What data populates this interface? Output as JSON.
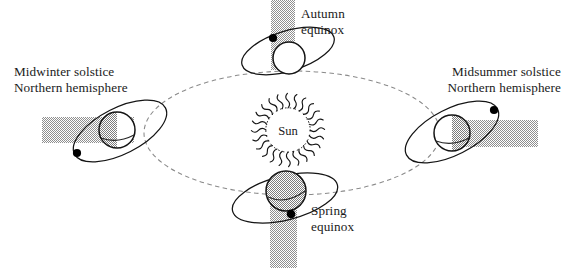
{
  "figure": {
    "background_color": "#ffffff",
    "ink_color": "#141414",
    "shadow_color": "#9b9b9b",
    "orbit_color": "#8a8a8a"
  },
  "sun": {
    "label": "Sun",
    "center": {
      "x": 288,
      "y": 130
    },
    "core_radius": 22,
    "ray_count": 24,
    "ray_length": 13
  },
  "orbit": {
    "name": "earth-orbit-ellipse",
    "center": {
      "x": 292,
      "y": 133
    },
    "rx": 148,
    "ry": 62,
    "style": "dashed"
  },
  "positions": [
    {
      "key": "midwinter",
      "label_lines": [
        "Midwinter solstice",
        "Northern hemisphere"
      ],
      "label_x": 14,
      "label_y": 76,
      "label_anchor": "start",
      "earth": {
        "x": 117,
        "y": 130,
        "r": 18
      },
      "ring": {
        "cx": 120,
        "cy": 131,
        "rx": 51,
        "ry": 23,
        "rotate": -27
      },
      "node_dot": {
        "x": 77,
        "y": 153
      },
      "shadow": {
        "x": 42,
        "y": 117,
        "w": 92,
        "h": 26,
        "direction": "left"
      },
      "earth_shading": "left-half-shadowed"
    },
    {
      "key": "autumn",
      "label_lines": [
        "Autumn",
        "equinox"
      ],
      "label_x": 301,
      "label_y": 18,
      "label_anchor": "start",
      "earth": {
        "x": 289,
        "y": 58,
        "r": 16
      },
      "ring": {
        "cx": 288,
        "cy": 51,
        "rx": 48,
        "ry": 20,
        "rotate": -17
      },
      "node_dot": {
        "x": 273,
        "y": 38
      },
      "shadow": {
        "x": 271,
        "y": 0,
        "w": 24,
        "h": 70,
        "direction": "up"
      },
      "earth_shading": "unshaded"
    },
    {
      "key": "midsummer",
      "label_lines": [
        "Midsummer solstice",
        "Northern hemisphere"
      ],
      "label_x": 561,
      "label_y": 76,
      "label_anchor": "end",
      "earth": {
        "x": 452,
        "y": 133,
        "r": 18
      },
      "ring": {
        "cx": 452,
        "cy": 132,
        "rx": 51,
        "ry": 23,
        "rotate": -27
      },
      "node_dot": {
        "x": 494,
        "y": 110
      },
      "shadow": {
        "x": 440,
        "y": 120,
        "w": 98,
        "h": 27,
        "direction": "right"
      },
      "earth_shading": "right-half-shadowed"
    },
    {
      "key": "spring",
      "label_lines": [
        "Spring",
        "equinox"
      ],
      "label_x": 311,
      "label_y": 215,
      "label_anchor": "start",
      "earth": {
        "x": 286,
        "y": 191,
        "r": 20
      },
      "ring": {
        "cx": 285,
        "cy": 198,
        "rx": 54,
        "ry": 22,
        "rotate": -14
      },
      "node_dot": {
        "x": 291,
        "y": 214
      },
      "shadow": {
        "x": 270,
        "y": 182,
        "w": 27,
        "h": 86,
        "direction": "down"
      },
      "earth_shading": "fully-shadowed"
    }
  ]
}
